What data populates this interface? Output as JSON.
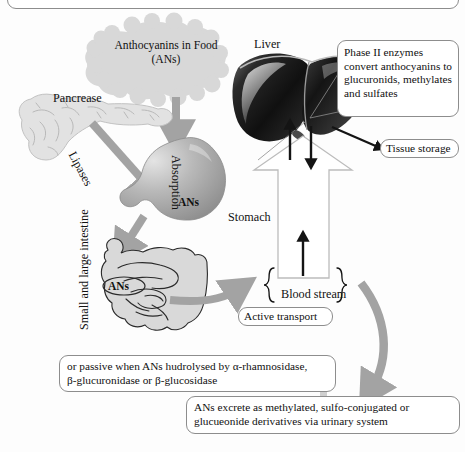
{
  "diagram": {
    "title_region": {
      "clipped_top_box": ""
    },
    "organs": {
      "liver_label": "Liver",
      "pancreas_label": "Pancrease",
      "stomach_label": "Stomach",
      "intestine_label": "Small and large intestine",
      "absorption_label": "Absorption",
      "stomach_ans_label": "ANs",
      "intestine_ans_label": "ANs"
    },
    "arrow_labels": {
      "lipases": "Lipases",
      "blood_stream": "Blood stream"
    },
    "source_cloud": {
      "line1": "Anthocyanins in Food",
      "line2": "(ANs)",
      "text": "Anthocyanins in Food\n(ANs)"
    },
    "callouts": [
      {
        "name": "phase-two-enzymes",
        "text": "Phase II enzymes convert anthocyanins to glucuronids, methylates and sulfates"
      },
      {
        "name": "tissue-storage",
        "text": "Tissue storage"
      },
      {
        "name": "active-transport",
        "text": "Active transport"
      },
      {
        "name": "passive-hydrolysis",
        "text": "or passive when ANs hudrolysed by α-rhamnosidase,\nβ-glucuronidase or β-glucosidase"
      },
      {
        "name": "excretion",
        "text": "ANs excrete as methylated, sulfo-conjugated or\nglucueonide derivatives via urinary system"
      }
    ],
    "colors": {
      "background": "#fdfdfd",
      "arrow_gray": "#a3a3a3",
      "cloud_gray": "#d8d8d8",
      "organ_gray": "#d5d5d5",
      "liver_dark": "#1d1d1d",
      "stomach_gray": "#a9a9a9",
      "box_border": "#8d8d8d",
      "text_black": "#111111",
      "vessel_outline": "#b5b5b5"
    }
  }
}
